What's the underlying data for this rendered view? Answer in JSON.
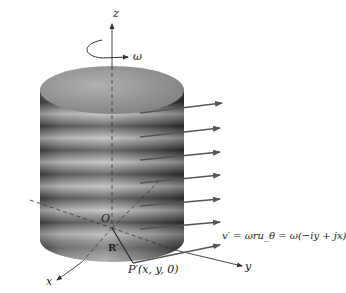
{
  "diagram": {
    "type": "rotating-cylinder-velocity-field",
    "axes": {
      "z_label": "z",
      "y_label": "y",
      "x_label": "x",
      "origin_label": "O"
    },
    "rotation": {
      "label": "ω"
    },
    "position_vector": {
      "label": "R′"
    },
    "point": {
      "label": "P′(x, y, 0)"
    },
    "velocity_equation": {
      "label": "v′ = ωru_θ = ω(−iy + jx)"
    },
    "velocity_arrows_count": 7,
    "colors": {
      "cylinder_dark": "#3a3a3a",
      "cylinder_light": "#bdbdbd",
      "top_face": "#9a9a9a",
      "arrow": "#555555",
      "axis": "#333333"
    }
  }
}
